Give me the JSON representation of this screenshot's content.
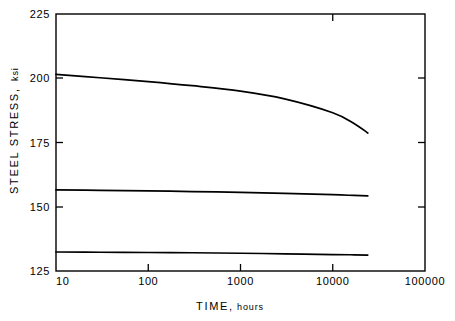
{
  "chart_data": {
    "type": "line",
    "title": "",
    "xlabel_major": "TIME,",
    "xlabel_minor": "hours",
    "xlabel": "TIME, hours",
    "ylabel_major": "STEEL  STRESS,",
    "ylabel_minor": "ksi",
    "ylabel": "STEEL STRESS, ksi",
    "xscale": "log",
    "yscale": "linear",
    "xlim": [
      10,
      100000
    ],
    "ylim": [
      125,
      225
    ],
    "grid": false,
    "legend": "none",
    "xticks": [
      10,
      100,
      1000,
      10000,
      100000
    ],
    "xtick_labels": [
      "10",
      "100",
      "1000",
      "10000",
      "100000"
    ],
    "yticks": [
      125,
      150,
      175,
      200,
      225
    ],
    "ytick_labels": [
      "125",
      "150",
      "175",
      "200",
      "225"
    ],
    "series": [
      {
        "name": "upper-curve",
        "x": [
          10,
          30,
          100,
          300,
          1000,
          3000,
          10000,
          17000,
          24000
        ],
        "values": [
          201.5,
          200.2,
          198.7,
          197.1,
          195.0,
          192.0,
          186.6,
          182.4,
          178.7
        ]
      },
      {
        "name": "middle-curve",
        "x": [
          10,
          30,
          100,
          300,
          1000,
          3000,
          10000,
          17000,
          24000
        ],
        "values": [
          156.6,
          156.4,
          156.2,
          155.9,
          155.6,
          155.2,
          154.7,
          154.4,
          154.2
        ]
      },
      {
        "name": "lower-curve",
        "x": [
          10,
          30,
          100,
          300,
          1000,
          3000,
          10000,
          17000,
          24000
        ],
        "values": [
          132.4,
          132.3,
          132.2,
          132.1,
          131.9,
          131.7,
          131.4,
          131.3,
          131.2
        ]
      }
    ]
  }
}
